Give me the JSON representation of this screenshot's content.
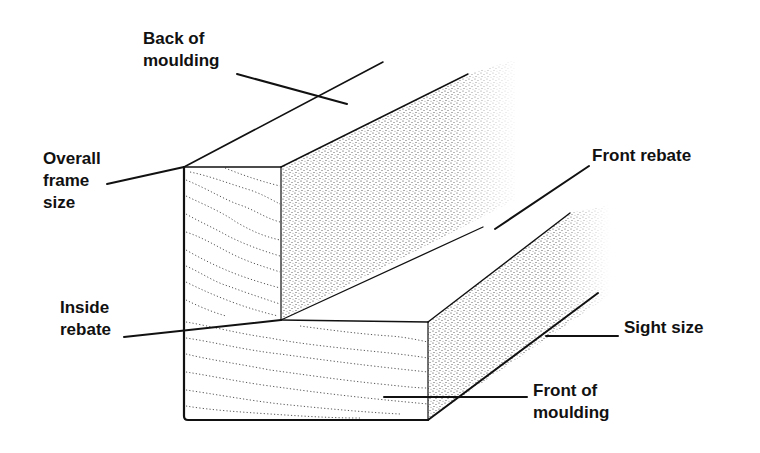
{
  "diagram": {
    "colors": {
      "ink": "#111111",
      "background": "#ffffff"
    },
    "labels": [
      {
        "id": "back-of-moulding",
        "lines": [
          "Back of",
          "moulding"
        ]
      },
      {
        "id": "overall-frame-size",
        "lines": [
          "Overall",
          "frame",
          "size"
        ]
      },
      {
        "id": "front-rebate",
        "lines": [
          "Front rebate"
        ]
      },
      {
        "id": "inside-rebate",
        "lines": [
          "Inside",
          "rebate"
        ]
      },
      {
        "id": "sight-size",
        "lines": [
          "Sight size"
        ]
      },
      {
        "id": "front-of-moulding",
        "lines": [
          "Front of",
          "moulding"
        ]
      }
    ]
  }
}
